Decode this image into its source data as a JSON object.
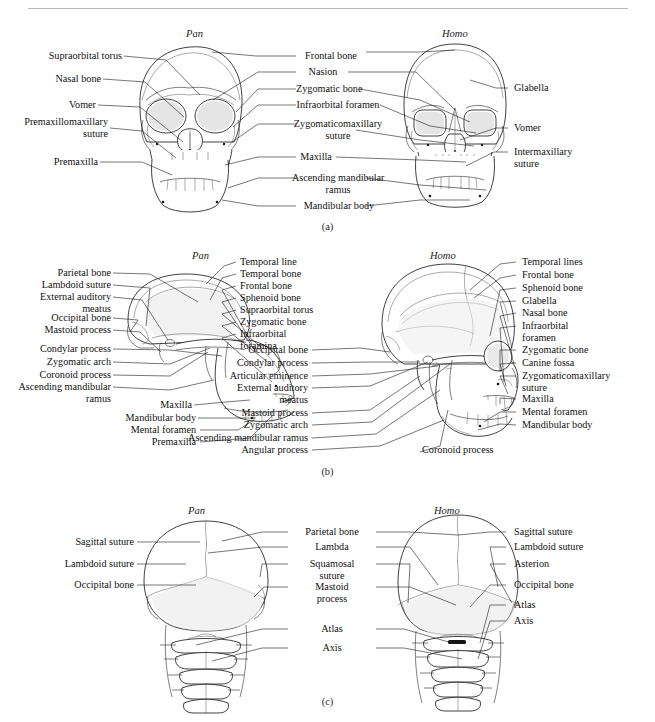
{
  "figure": {
    "background": "#ffffff",
    "ink": "#1a1a1a",
    "rule_color": "#b9b9b9"
  },
  "panels": [
    {
      "letter": "(a)",
      "view": "anterior",
      "genus_left": "Pan",
      "genus_right": "Homo",
      "labels_left": [
        "Supraorbital torus",
        "Nasal bone",
        "Vomer",
        "Premaxillomaxillary\nsuture",
        "Premaxilla"
      ],
      "labels_center": [
        "Frontal bone",
        "Nasion",
        "Zygomatic bone",
        "Infraorbital foramen",
        "Zygomaticomaxillary\nsuture",
        "Maxilla",
        "Ascending mandibular\nramus",
        "Mandibular body"
      ],
      "labels_right": [
        "Glabella",
        "Vomer",
        "Intermaxillary\nsuture"
      ]
    },
    {
      "letter": "(b)",
      "view": "lateral",
      "genus_left": "Pan",
      "genus_right": "Homo",
      "labels_left": [
        "Parietal bone",
        "Lambdoid suture",
        "External auditory\nmeatus",
        "Occipital bone",
        "Mastoid process",
        "Condylar process",
        "Zygomatic arch",
        "Coronoid process",
        "Ascending mandibular\nramus",
        "Maxilla",
        "Mandibular body",
        "Mental foramen",
        "Premaxilla"
      ],
      "labels_center_upper": [
        "Temporal line",
        "Temporal bone",
        "Frontal bone",
        "Sphenoid bone",
        "Supraorbital torus",
        "Zygomatic bone",
        "Infraorbital\nforamina"
      ],
      "labels_center_lower": [
        "Occipital bone",
        "Condylar process",
        "Articular eminence",
        "External auditory\nmeatus",
        "Mastoid process",
        "Zygomatic arch",
        "Ascending mandibular ramus",
        "Angular process",
        "Coronoid process"
      ],
      "labels_right": [
        "Temporal lines",
        "Frontal bone",
        "Sphenoid bone",
        "Glabella",
        "Nasal bone",
        "Infraorbital\nforamen",
        "Zygomatic bone",
        "Canine fossa",
        "Zygomaticomaxillary\nsuture",
        "Maxilla",
        "Mental foramen",
        "Mandibular body"
      ]
    },
    {
      "letter": "(c)",
      "view": "posterior",
      "genus_left": "Pan",
      "genus_right": "Homo",
      "labels_left": [
        "Sagittal suture",
        "Lambdoid suture",
        "Occipital bone"
      ],
      "labels_center": [
        "Parietal bone",
        "Lambda",
        "Squamosal\nsuture",
        "Mastoid\nprocess",
        "Atlas",
        "Axis"
      ],
      "labels_right": [
        "Sagittal suture",
        "Lambdoid suture",
        "Asterion",
        "Occipital bone",
        "Atlas",
        "Axis"
      ]
    }
  ]
}
